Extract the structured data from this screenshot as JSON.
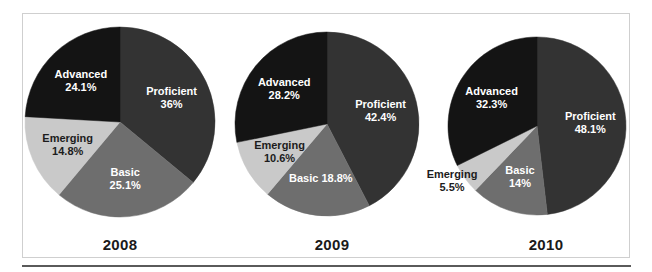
{
  "figure": {
    "background": "#ffffff",
    "frame_border_color": "#cfcfcf",
    "rule_color": "#5a5a5a"
  },
  "palette": {
    "Proficient": "#333333",
    "Basic": "#6e6e6e",
    "Emerging": "#c9c9c9",
    "Advanced": "#141414"
  },
  "years": {
    "y2008": "2008",
    "y2009": "2009",
    "y2010": "2010"
  },
  "labels": {
    "c0_s0_name": "Proficient",
    "c0_s0_value": "36%",
    "c0_s1_name": "Basic",
    "c0_s1_value": "25.1%",
    "c0_s2_name": "Emerging",
    "c0_s2_value": "14.8%",
    "c0_s3_name": "Advanced",
    "c0_s3_value": "24.1%",
    "c1_s0_name": "Proficient",
    "c1_s0_value": "42.4%",
    "c1_s1_name": "Basic 18.8%",
    "c1_s1_value": "",
    "c1_s2_name": "Emerging",
    "c1_s2_value": "10.6%",
    "c1_s3_name": "Advanced",
    "c1_s3_value": "28.2%",
    "c2_s0_name": "Proficient",
    "c2_s0_value": "48.1%",
    "c2_s1_name": "Basic",
    "c2_s1_value": "14%",
    "c2_s2_name": "Emerging",
    "c2_s2_value": "5.5%",
    "c2_s3_name": "Advanced",
    "c2_s3_value": "32.3%"
  },
  "chart_data": [
    {
      "type": "pie",
      "title": "2008",
      "categories": [
        "Proficient",
        "Basic",
        "Emerging",
        "Advanced"
      ],
      "values": [
        36.0,
        25.1,
        14.8,
        24.1
      ],
      "value_labels": [
        "36%",
        "25.1%",
        "14.8%",
        "24.1%"
      ],
      "colors": [
        "#333333",
        "#6e6e6e",
        "#c9c9c9",
        "#141414"
      ],
      "start_angle_deg": 0,
      "direction": "clockwise",
      "legend": "none",
      "labels_inside": true
    },
    {
      "type": "pie",
      "title": "2009",
      "categories": [
        "Proficient",
        "Basic",
        "Emerging",
        "Advanced"
      ],
      "values": [
        42.4,
        18.8,
        10.6,
        28.2
      ],
      "value_labels": [
        "42.4%",
        "18.8%",
        "10.6%",
        "28.2%"
      ],
      "colors": [
        "#333333",
        "#6e6e6e",
        "#c9c9c9",
        "#141414"
      ],
      "start_angle_deg": 0,
      "direction": "clockwise",
      "legend": "none",
      "labels_inside": true
    },
    {
      "type": "pie",
      "title": "2010",
      "categories": [
        "Proficient",
        "Basic",
        "Emerging",
        "Advanced"
      ],
      "values": [
        48.1,
        14.0,
        5.5,
        32.3
      ],
      "value_labels": [
        "48.1%",
        "14%",
        "5.5%",
        "32.3%"
      ],
      "colors": [
        "#333333",
        "#6e6e6e",
        "#c9c9c9",
        "#141414"
      ],
      "start_angle_deg": 0,
      "direction": "clockwise",
      "legend": "none",
      "labels_inside": false
    }
  ],
  "geometry": {
    "pies": [
      {
        "cx": 120,
        "cy": 122,
        "r": 95
      },
      {
        "cx": 327,
        "cy": 124,
        "r": 92
      },
      {
        "cx": 537,
        "cy": 126,
        "r": 89
      }
    ],
    "year_positions": [
      {
        "x": 120,
        "y": 236
      },
      {
        "x": 332,
        "y": 236
      },
      {
        "x": 546,
        "y": 236
      }
    ],
    "label_overrides": {
      "c2_s2": {
        "x": 452,
        "y": 181,
        "anchor": "middle",
        "fill": "dark"
      }
    }
  }
}
